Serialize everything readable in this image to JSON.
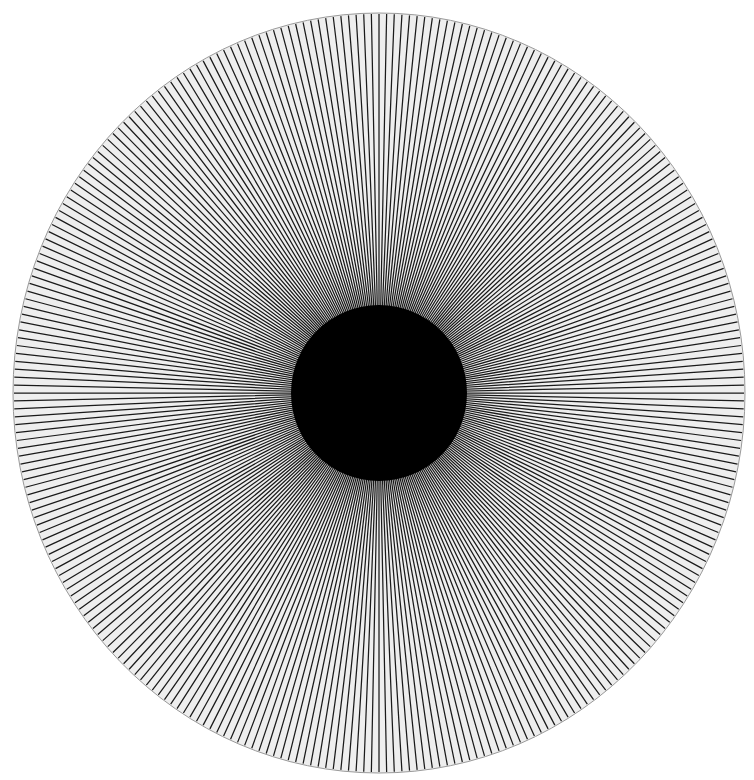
{
  "pattern": {
    "type": "radial-line-star",
    "spoke_count": 300,
    "center": {
      "x": 379,
      "y": 393
    },
    "radius_x": 366,
    "radius_y": 380,
    "background_color": "#ffffff",
    "disc_fill_color": "#eeeeee",
    "disc_outline_color": "#9a9a9a",
    "spoke_color": "#1a1a1a",
    "spoke_width": 1.25,
    "core_color": "#000000"
  }
}
